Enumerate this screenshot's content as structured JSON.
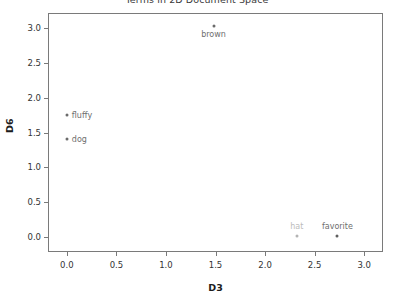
{
  "chart_data": {
    "type": "scatter",
    "title": "Terms in 2D Document Space",
    "xlabel": "D3",
    "ylabel": "D6",
    "xlim": [
      -0.18,
      3.18
    ],
    "ylim": [
      -0.2,
      3.2
    ],
    "xticks": [
      "0.0",
      "0.5",
      "1.0",
      "1.5",
      "2.0",
      "2.5",
      "3.0"
    ],
    "xtick_values": [
      0.0,
      0.5,
      1.0,
      1.5,
      2.0,
      2.5,
      3.0
    ],
    "yticks": [
      "0.0",
      "0.5",
      "1.0",
      "1.5",
      "2.0",
      "2.5",
      "3.0"
    ],
    "ytick_values": [
      0.0,
      0.5,
      1.0,
      1.5,
      2.0,
      2.5,
      3.0
    ],
    "grid": false,
    "legend": "none",
    "marker_color": "#7a7a7a",
    "label_color": "#6e6e6e",
    "points": [
      {
        "label": "brown",
        "x": 1.48,
        "y": 3.03,
        "label_pos": "below",
        "color": "#6b6b6b",
        "label_color": "#6e6e6e"
      },
      {
        "label": "fluffy",
        "x": 0.0,
        "y": 1.75,
        "label_pos": "right",
        "color": "#6b6b6b",
        "label_color": "#6e6e6e"
      },
      {
        "label": "dog",
        "x": 0.0,
        "y": 1.4,
        "label_pos": "right",
        "color": "#6b6b6b",
        "label_color": "#6e6e6e"
      },
      {
        "label": "hat",
        "x": 2.32,
        "y": 0.02,
        "label_pos": "above",
        "color": "#b4b4b4",
        "label_color": "#bcbcbc"
      },
      {
        "label": "favorite",
        "x": 2.73,
        "y": 0.02,
        "label_pos": "above",
        "color": "#5e5e5e",
        "label_color": "#6e6e6e"
      }
    ]
  }
}
